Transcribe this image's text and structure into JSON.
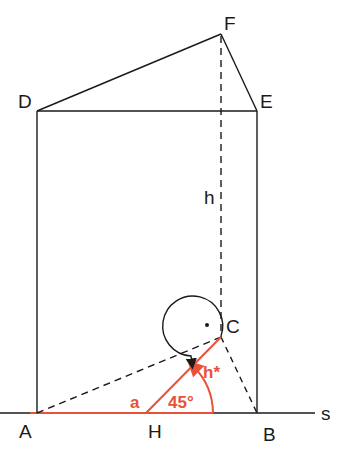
{
  "diagram": {
    "type": "geometric-construction",
    "colors": {
      "line": "#1a1a1a",
      "accent": "#e8513a"
    },
    "points": {
      "A": "A",
      "B": "B",
      "C": "C",
      "D": "D",
      "E": "E",
      "F": "F",
      "H": "H"
    },
    "line_labels": {
      "s": "s",
      "h": "h",
      "h_star": "h*",
      "a": "a"
    },
    "angle_label": "45°",
    "right_angle_mark": "·"
  }
}
